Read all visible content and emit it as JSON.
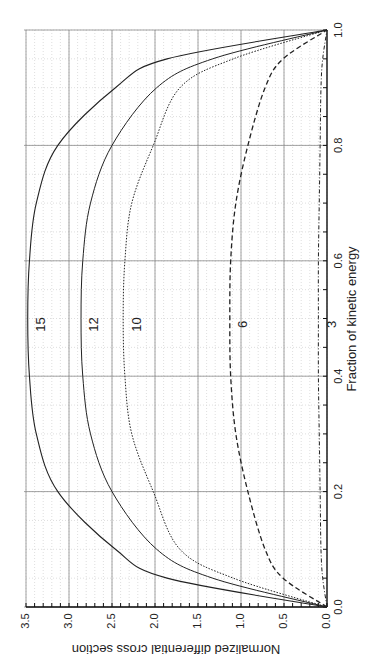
{
  "chart_data": {
    "type": "line",
    "orientation": "rotated-90-clockwise",
    "title": "",
    "xlabel": "Fraction of kinetic energy",
    "ylabel": "Normalized differential cross section",
    "xlim": [
      0.0,
      1.0
    ],
    "ylim": [
      0.0,
      3.5
    ],
    "x_ticks": [
      "0.0",
      "0.2",
      "0.4",
      "0.6",
      "0.8",
      "1.0"
    ],
    "y_ticks": [
      "0.0",
      "0.5",
      "1.0",
      "1.5",
      "2.0",
      "2.5",
      "3.0",
      "3.5"
    ],
    "grid": true,
    "legend": "inline curve labels",
    "x": [
      0.0,
      0.05,
      0.1,
      0.2,
      0.3,
      0.4,
      0.5,
      0.6,
      0.7,
      0.8,
      0.9,
      0.95,
      1.0
    ],
    "series": [
      {
        "name": "15",
        "style": "solid",
        "values": [
          0.0,
          1.86,
          2.46,
          3.13,
          3.38,
          3.46,
          3.48,
          3.46,
          3.38,
          3.13,
          2.46,
          1.86,
          0.0
        ]
      },
      {
        "name": "12",
        "style": "solid-thin",
        "values": [
          0.0,
          1.33,
          1.98,
          2.5,
          2.75,
          2.84,
          2.86,
          2.84,
          2.75,
          2.5,
          1.98,
          1.33,
          0.0
        ]
      },
      {
        "name": "10",
        "style": "dotted",
        "values": [
          0.0,
          1.09,
          1.71,
          2.02,
          2.27,
          2.35,
          2.37,
          2.35,
          2.27,
          2.02,
          1.71,
          1.09,
          0.0
        ]
      },
      {
        "name": "6",
        "style": "dashed",
        "values": [
          0.0,
          0.51,
          0.72,
          0.92,
          1.06,
          1.12,
          1.13,
          1.12,
          1.06,
          0.92,
          0.72,
          0.51,
          0.0
        ]
      },
      {
        "name": "3",
        "style": "dash-dot",
        "values": [
          0.0,
          0.05,
          0.07,
          0.08,
          0.09,
          0.1,
          0.1,
          0.1,
          0.09,
          0.08,
          0.07,
          0.05,
          0.0
        ]
      }
    ],
    "label_positions_x": 0.5
  }
}
